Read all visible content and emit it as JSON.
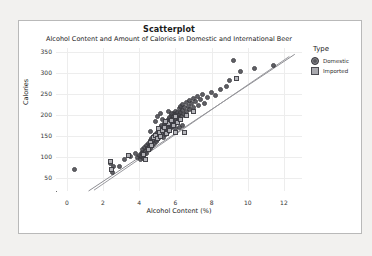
{
  "chart_data": {
    "type": "scatter",
    "title": "Scatterplot",
    "subtitle": "Alcohol Content and Amount of Calories in Domestic and International Beer",
    "xlabel": "Alcohol Content (%)",
    "ylabel": "Calories",
    "xlim": [
      -0.6,
      13.0
    ],
    "ylim": [
      20,
      360
    ],
    "xticks": [
      0,
      2,
      4,
      6,
      8,
      10,
      12
    ],
    "yticks": [
      50,
      100,
      150,
      200,
      250,
      300,
      350
    ],
    "grid": true,
    "legend": {
      "title": "Type",
      "position": "right",
      "entries": [
        {
          "label": "Domestic",
          "marker": "circle",
          "color": "#4a4a50"
        },
        {
          "label": "Imported",
          "marker": "square",
          "color": "#b5b5ba"
        }
      ]
    },
    "series": [
      {
        "name": "Domestic",
        "marker": "circle",
        "color": "#4a4a50",
        "points": [
          [
            0.4,
            70
          ],
          [
            2.4,
            85
          ],
          [
            2.6,
            78
          ],
          [
            2.5,
            64
          ],
          [
            2.9,
            79
          ],
          [
            3.2,
            96
          ],
          [
            3.5,
            103
          ],
          [
            3.8,
            110
          ],
          [
            3.9,
            99
          ],
          [
            4.0,
            104
          ],
          [
            4.05,
            95
          ],
          [
            4.1,
            108
          ],
          [
            4.15,
            101
          ],
          [
            4.2,
            112
          ],
          [
            4.25,
            98
          ],
          [
            4.2,
            118
          ],
          [
            4.3,
            107
          ],
          [
            4.3,
            124
          ],
          [
            4.35,
            115
          ],
          [
            4.4,
            110
          ],
          [
            4.4,
            128
          ],
          [
            4.45,
            120
          ],
          [
            4.5,
            133
          ],
          [
            4.5,
            118
          ],
          [
            4.55,
            126
          ],
          [
            4.6,
            140
          ],
          [
            4.6,
            131
          ],
          [
            4.65,
            122
          ],
          [
            4.7,
            145
          ],
          [
            4.7,
            136
          ],
          [
            4.75,
            128
          ],
          [
            4.8,
            150
          ],
          [
            4.8,
            141
          ],
          [
            4.85,
            133
          ],
          [
            4.9,
            155
          ],
          [
            4.9,
            146
          ],
          [
            4.95,
            138
          ],
          [
            5.0,
            160
          ],
          [
            5.0,
            151
          ],
          [
            5.0,
            143
          ],
          [
            5.05,
            165
          ],
          [
            5.1,
            156
          ],
          [
            5.1,
            148
          ],
          [
            5.15,
            170
          ],
          [
            5.2,
            161
          ],
          [
            5.2,
            153
          ],
          [
            5.25,
            175
          ],
          [
            5.3,
            166
          ],
          [
            5.3,
            158
          ],
          [
            5.35,
            148
          ],
          [
            5.4,
            180
          ],
          [
            5.4,
            171
          ],
          [
            5.4,
            162
          ],
          [
            5.45,
            154
          ],
          [
            5.5,
            185
          ],
          [
            5.5,
            176
          ],
          [
            5.5,
            167
          ],
          [
            5.55,
            159
          ],
          [
            5.6,
            190
          ],
          [
            5.6,
            181
          ],
          [
            5.6,
            172
          ],
          [
            5.65,
            163
          ],
          [
            5.7,
            195
          ],
          [
            5.7,
            186
          ],
          [
            5.7,
            177
          ],
          [
            5.75,
            168
          ],
          [
            5.8,
            200
          ],
          [
            5.8,
            191
          ],
          [
            5.8,
            182
          ],
          [
            5.85,
            173
          ],
          [
            5.9,
            205
          ],
          [
            5.9,
            196
          ],
          [
            5.9,
            187
          ],
          [
            5.95,
            178
          ],
          [
            6.0,
            210
          ],
          [
            6.0,
            201
          ],
          [
            6.0,
            192
          ],
          [
            6.05,
            183
          ],
          [
            6.1,
            206
          ],
          [
            6.1,
            197
          ],
          [
            6.15,
            188
          ],
          [
            6.2,
            215
          ],
          [
            6.2,
            202
          ],
          [
            6.25,
            193
          ],
          [
            6.3,
            220
          ],
          [
            6.3,
            207
          ],
          [
            6.35,
            198
          ],
          [
            6.4,
            212
          ],
          [
            6.4,
            225
          ],
          [
            6.5,
            203
          ],
          [
            6.5,
            218
          ],
          [
            6.6,
            230
          ],
          [
            6.6,
            208
          ],
          [
            6.7,
            222
          ],
          [
            6.8,
            235
          ],
          [
            6.8,
            213
          ],
          [
            6.9,
            227
          ],
          [
            7.0,
            240
          ],
          [
            7.0,
            218
          ],
          [
            7.1,
            232
          ],
          [
            7.2,
            245
          ],
          [
            7.3,
            224
          ],
          [
            7.4,
            238
          ],
          [
            7.5,
            250
          ],
          [
            7.6,
            229
          ],
          [
            7.8,
            243
          ],
          [
            8.0,
            255
          ],
          [
            8.2,
            248
          ],
          [
            8.5,
            262
          ],
          [
            8.8,
            268
          ],
          [
            9.0,
            282
          ],
          [
            9.2,
            330
          ],
          [
            9.6,
            305
          ],
          [
            10.4,
            312
          ],
          [
            11.4,
            318
          ],
          [
            5.2,
            205
          ],
          [
            5.6,
            210
          ],
          [
            6.0,
            168
          ],
          [
            6.4,
            175
          ],
          [
            5.0,
            196
          ],
          [
            4.9,
            186
          ],
          [
            5.3,
            191
          ],
          [
            5.8,
            205
          ],
          [
            6.2,
            172
          ],
          [
            4.6,
            162
          ]
        ]
      },
      {
        "name": "Imported",
        "marker": "square",
        "color": "#b5b5ba",
        "points": [
          [
            2.4,
            90
          ],
          [
            2.45,
            72
          ],
          [
            3.4,
            104
          ],
          [
            4.25,
            106
          ],
          [
            4.5,
            118
          ],
          [
            4.6,
            135
          ],
          [
            4.7,
            128
          ],
          [
            4.8,
            147
          ],
          [
            4.9,
            152
          ],
          [
            5.0,
            144
          ],
          [
            5.1,
            159
          ],
          [
            5.2,
            150
          ],
          [
            5.3,
            163
          ],
          [
            5.4,
            172
          ],
          [
            5.5,
            157
          ],
          [
            5.6,
            180
          ],
          [
            5.7,
            165
          ],
          [
            5.8,
            188
          ],
          [
            5.9,
            175
          ],
          [
            6.0,
            196
          ],
          [
            6.1,
            182
          ],
          [
            6.3,
            190
          ],
          [
            6.5,
            158
          ],
          [
            6.6,
            200
          ],
          [
            7.0,
            210
          ],
          [
            9.4,
            288
          ],
          [
            4.35,
            96
          ],
          [
            5.05,
            168
          ],
          [
            5.45,
            186
          ],
          [
            6.0,
            160
          ]
        ]
      }
    ],
    "fit_lines": [
      {
        "name": "Domestic fit",
        "x1": 1.2,
        "y1": 20,
        "x2": 12.6,
        "y2": 345,
        "color": "#8d8d92"
      },
      {
        "name": "Imported fit",
        "x1": 1.5,
        "y1": 22,
        "x2": 12.3,
        "y2": 340,
        "color": "#9a9a9f"
      }
    ]
  }
}
